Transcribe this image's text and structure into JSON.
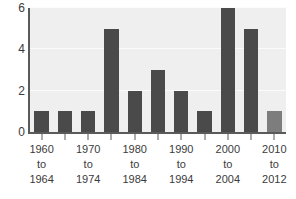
{
  "chart_data": {
    "type": "bar",
    "title": "",
    "subtitle": "",
    "xlabel": "",
    "ylabel": "",
    "ylim": [
      0,
      6
    ],
    "y_ticks": [
      0,
      2,
      4,
      6
    ],
    "y_tick_labels": [
      "0",
      "2",
      "4",
      "6"
    ],
    "grid": true,
    "grid_orientation": "horizontal",
    "legend": false,
    "legend_position": "none",
    "categories": [
      "1960 to 1964",
      "1965 to 1969",
      "1970 to 1974",
      "1975 to 1979",
      "1980 to 1984",
      "1985 to 1989",
      "1990 to 1994",
      "1995 to 1999",
      "2000 to 2004",
      "2005 to 2009",
      "2010 to 2012"
    ],
    "values": [
      1,
      1,
      1,
      5,
      2,
      3,
      2,
      1,
      6,
      5,
      1
    ],
    "bar_colors": [
      "#4a4a4a",
      "#4a4a4a",
      "#4a4a4a",
      "#4a4a4a",
      "#4a4a4a",
      "#4a4a4a",
      "#4a4a4a",
      "#4a4a4a",
      "#4a4a4a",
      "#4a4a4a",
      "#7d7d7d"
    ],
    "x_tick_labels": [
      {
        "line1": "1960",
        "line2": "to",
        "line3": "1964"
      },
      {
        "line1": "1970",
        "line2": "to",
        "line3": "1974"
      },
      {
        "line1": "1980",
        "line2": "to",
        "line3": "1984"
      },
      {
        "line1": "1990",
        "line2": "to",
        "line3": "1994"
      },
      {
        "line1": "2000",
        "line2": "to",
        "line3": "2004"
      },
      {
        "line1": "2010",
        "line2": "to",
        "line3": "2012"
      }
    ],
    "x_tick_label_indices": [
      0,
      2,
      4,
      6,
      8,
      10
    ]
  },
  "colors": {
    "plot_background": "#efefef",
    "page_background": "#ffffff",
    "axis_line": "#5a5a5a",
    "gridline": "#fbfbfb",
    "bar_primary": "#4a4a4a",
    "bar_highlight": "#7d7d7d",
    "text": "#3b3b3b"
  }
}
